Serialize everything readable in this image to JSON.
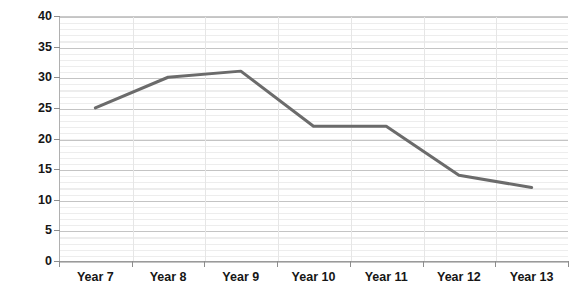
{
  "chart_data": {
    "type": "line",
    "title": "",
    "subtitle": "",
    "xlabel": "",
    "ylabel": "",
    "categories": [
      "Year 7",
      "Year 8",
      "Year 9",
      "Year 10",
      "Year 11",
      "Year 12",
      "Year 13"
    ],
    "series": [
      {
        "name": "Series 1",
        "values": [
          25,
          30,
          31,
          22,
          22,
          14,
          12
        ],
        "color": "#6b6b6b"
      }
    ],
    "ylim": [
      0,
      40
    ],
    "y_ticks": [
      0,
      5,
      10,
      15,
      20,
      25,
      30,
      35,
      40
    ],
    "y_tick_labels": [
      "0",
      "5",
      "10",
      "15",
      "20",
      "25",
      "30",
      "35",
      "40"
    ],
    "y_minor_step": 1,
    "grid": {
      "horizontal_major": true,
      "horizontal_minor": true,
      "vertical_category_separators": true,
      "major_color": "#c4c4c4",
      "minor_color": "#ededed"
    },
    "legend": {
      "visible": false,
      "position": "none"
    },
    "plot_background": "#ffffff",
    "axis_color": "#9a9a9a",
    "label_color": "#161616"
  }
}
